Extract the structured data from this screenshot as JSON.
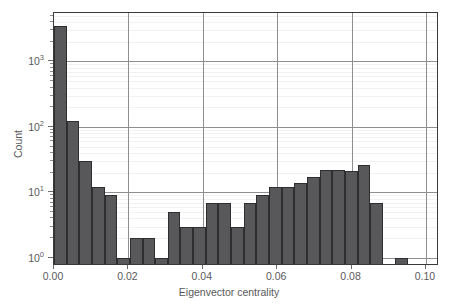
{
  "chart_data": {
    "type": "bar",
    "title": "",
    "subtitle": "",
    "xlabel": "Eigenvector centrality",
    "ylabel": "Count",
    "xlim": [
      0.0,
      0.1035
    ],
    "ylim": [
      0.75,
      5500
    ],
    "yscale": "log",
    "grid": true,
    "legend": null,
    "bar_color": "#58585a",
    "bar_edge_color": "#2e2e30",
    "bin_width": 0.0034,
    "xticks": [
      0.0,
      0.02,
      0.04,
      0.06,
      0.08,
      0.1
    ],
    "xtick_labels": [
      "0.00",
      "0.02",
      "0.04",
      "0.06",
      "0.08",
      "0.10"
    ],
    "yticks": [
      1,
      10,
      100,
      1000
    ],
    "ytick_labels": [
      "10⁰",
      "10¹",
      "10²",
      "10³"
    ],
    "ytick_exponents": [
      "0",
      "1",
      "2",
      "3"
    ],
    "bins": [
      {
        "x0": 0.0,
        "x1": 0.0034,
        "count": 3500
      },
      {
        "x0": 0.0034,
        "x1": 0.0068,
        "count": 125
      },
      {
        "x0": 0.0068,
        "x1": 0.0102,
        "count": 30
      },
      {
        "x0": 0.0102,
        "x1": 0.0136,
        "count": 12
      },
      {
        "x0": 0.0136,
        "x1": 0.017,
        "count": 9
      },
      {
        "x0": 0.017,
        "x1": 0.0204,
        "count": 1
      },
      {
        "x0": 0.0204,
        "x1": 0.0238,
        "count": 2
      },
      {
        "x0": 0.0238,
        "x1": 0.0272,
        "count": 2
      },
      {
        "x0": 0.0272,
        "x1": 0.0306,
        "count": 1
      },
      {
        "x0": 0.0306,
        "x1": 0.034,
        "count": 5
      },
      {
        "x0": 0.034,
        "x1": 0.0374,
        "count": 3
      },
      {
        "x0": 0.0374,
        "x1": 0.0408,
        "count": 3
      },
      {
        "x0": 0.0408,
        "x1": 0.0442,
        "count": 7
      },
      {
        "x0": 0.0442,
        "x1": 0.0476,
        "count": 7
      },
      {
        "x0": 0.0476,
        "x1": 0.051,
        "count": 3
      },
      {
        "x0": 0.051,
        "x1": 0.0544,
        "count": 7
      },
      {
        "x0": 0.0544,
        "x1": 0.0578,
        "count": 9
      },
      {
        "x0": 0.0578,
        "x1": 0.0612,
        "count": 12
      },
      {
        "x0": 0.0612,
        "x1": 0.0646,
        "count": 12
      },
      {
        "x0": 0.0646,
        "x1": 0.068,
        "count": 14
      },
      {
        "x0": 0.068,
        "x1": 0.0714,
        "count": 17
      },
      {
        "x0": 0.0714,
        "x1": 0.0748,
        "count": 22
      },
      {
        "x0": 0.0748,
        "x1": 0.0782,
        "count": 22
      },
      {
        "x0": 0.0782,
        "x1": 0.0816,
        "count": 21
      },
      {
        "x0": 0.0816,
        "x1": 0.085,
        "count": 26
      },
      {
        "x0": 0.085,
        "x1": 0.0884,
        "count": 7
      },
      {
        "x0": 0.0918,
        "x1": 0.0952,
        "count": 1
      }
    ]
  }
}
